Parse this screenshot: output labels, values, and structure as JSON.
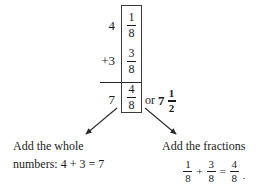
{
  "problem": {
    "type": "mixed-number-addition",
    "addends": [
      {
        "whole": "4",
        "sign": "",
        "numerator": "1",
        "denominator": "8"
      },
      {
        "whole": "3",
        "sign": "+",
        "numerator": "3",
        "denominator": "8"
      }
    ],
    "sum": {
      "whole": "7",
      "numerator": "4",
      "denominator": "8"
    },
    "simplified": {
      "or_label": "or",
      "whole": "7",
      "numerator": "1",
      "denominator": "2"
    }
  },
  "rows": {
    "row1_whole": "4",
    "row2_whole": "+3",
    "row3_whole": "7",
    "row1_num": "1",
    "row1_den": "8",
    "row2_num": "3",
    "row2_den": "8",
    "row3_num": "4",
    "row3_den": "8"
  },
  "captions": {
    "left": {
      "line1": "Add the whole",
      "line2": "numbers: 4 + 3 = 7"
    },
    "right": {
      "line1": "Add the fractions",
      "equation": {
        "a_num": "1",
        "a_den": "8",
        "op1": "+",
        "b_num": "3",
        "b_den": "8",
        "op2": "=",
        "c_num": "4",
        "c_den": "8",
        "period": "."
      }
    }
  },
  "icons": {
    "left_arrow": "arrow-down-left-icon",
    "right_arrow": "arrow-down-right-icon"
  },
  "colors": {
    "ink": "#1b1b1b",
    "rule": "#2a2a2a",
    "box_border": "#3a3a3a",
    "background": "#ffffff"
  }
}
